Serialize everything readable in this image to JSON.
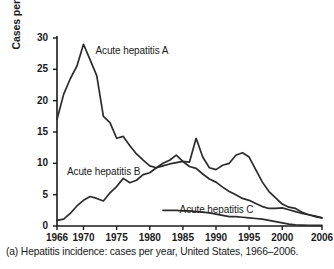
{
  "caption": "(a) Hepatitis incidence: cases per year, United States, 1966–2006.",
  "axis": {
    "ylabel": "Cases per 100,000 population",
    "xlabel": "",
    "yticks": [
      "0",
      "5",
      "10",
      "15",
      "20",
      "25",
      "30"
    ],
    "xticks": [
      "1966",
      "1970",
      "1975",
      "1980",
      "1985",
      "1990",
      "1995",
      "2000",
      "2006"
    ]
  },
  "labels": {
    "hep_a": "Acute hepatitis A",
    "hep_b": "Acute hepatitis B",
    "hep_c": "Acute hepatitis C"
  },
  "colors": {
    "line": "#2b2b2b",
    "axis": "#1a1a1a",
    "background": "#ffffff"
  },
  "chart_data": {
    "type": "line",
    "title": "",
    "subtitle": "",
    "xlabel": "",
    "ylabel": "Cases per 100,000 population",
    "xlim": [
      1966,
      2006
    ],
    "ylim": [
      0,
      30
    ],
    "yticks": [
      0,
      5,
      10,
      15,
      20,
      25,
      30
    ],
    "xticks": [
      1966,
      1970,
      1975,
      1980,
      1985,
      1990,
      1995,
      2000,
      2006
    ],
    "grid": false,
    "legend": "inline-annotations",
    "annotations": [
      {
        "text": "Acute hepatitis A",
        "x": 1971.5,
        "y": 28.0
      },
      {
        "text": "Acute hepatitis B",
        "x": 1967.5,
        "y": 8.6
      },
      {
        "text": "Acute hepatitis C",
        "x": 1984.5,
        "y": 2.6
      }
    ],
    "series": [
      {
        "name": "Acute hepatitis A",
        "x": [
          1966,
          1967,
          1968,
          1969,
          1970,
          1971,
          1972,
          1973,
          1974,
          1975,
          1976,
          1977,
          1978,
          1979,
          1980,
          1981,
          1982,
          1983,
          1984,
          1985,
          1986,
          1987,
          1988,
          1989,
          1990,
          1991,
          1992,
          1993,
          1994,
          1995,
          1996,
          1997,
          1998,
          1999,
          2000,
          2001,
          2002,
          2003,
          2004,
          2005,
          2006
        ],
        "values": [
          17.0,
          21.0,
          23.5,
          25.5,
          29.0,
          26.5,
          24.0,
          17.5,
          16.5,
          14.0,
          14.3,
          12.8,
          11.5,
          10.5,
          9.6,
          9.3,
          10.0,
          10.5,
          11.3,
          10.3,
          10.2,
          14.0,
          11.0,
          9.3,
          9.0,
          9.7,
          10.0,
          11.3,
          11.7,
          11.0,
          9.0,
          7.0,
          5.5,
          4.5,
          3.5,
          3.0,
          2.8,
          2.2,
          1.8,
          1.5,
          1.3
        ]
      },
      {
        "name": "Acute hepatitis B",
        "x": [
          1966,
          1967,
          1968,
          1969,
          1970,
          1971,
          1972,
          1973,
          1974,
          1975,
          1976,
          1977,
          1978,
          1979,
          1980,
          1981,
          1982,
          1983,
          1984,
          1985,
          1986,
          1987,
          1988,
          1989,
          1990,
          1991,
          1992,
          1993,
          1994,
          1995,
          1996,
          1997,
          1998,
          1999,
          2000,
          2001,
          2002,
          2003,
          2004,
          2005,
          2006
        ],
        "values": [
          0.9,
          1.1,
          2.0,
          3.2,
          4.1,
          4.7,
          4.4,
          4.0,
          5.3,
          6.3,
          7.6,
          6.9,
          7.3,
          8.2,
          8.5,
          9.3,
          9.6,
          9.9,
          10.1,
          10.3,
          9.5,
          9.2,
          8.3,
          7.5,
          7.0,
          6.2,
          5.5,
          5.0,
          4.4,
          4.1,
          3.6,
          3.1,
          2.8,
          2.8,
          2.9,
          2.6,
          2.3,
          2.0,
          1.8,
          1.6,
          1.3
        ]
      },
      {
        "name": "Acute hepatitis C",
        "x": [
          1982,
          1983,
          1984,
          1985,
          1986,
          1987,
          1988,
          1989,
          1990,
          1991,
          1992,
          1993,
          1994,
          1995,
          1996,
          1997,
          1998,
          1999,
          2000,
          2001,
          2002,
          2003,
          2004,
          2005,
          2006
        ],
        "values": [
          2.5,
          2.5,
          2.5,
          2.4,
          2.4,
          2.3,
          2.2,
          2.1,
          1.9,
          1.7,
          1.5,
          1.5,
          1.4,
          1.3,
          1.2,
          1.1,
          0.9,
          0.7,
          0.5,
          0.3,
          0.2,
          0.15,
          0.12,
          0.1,
          0.1
        ]
      }
    ]
  }
}
